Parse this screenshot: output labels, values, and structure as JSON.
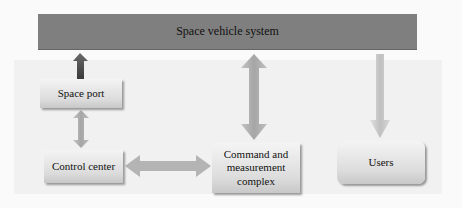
{
  "diagram": {
    "top_bar": {
      "label": "Space vehicle system"
    },
    "nodes": [
      {
        "id": "space-port",
        "label": "Space port"
      },
      {
        "id": "control-center",
        "label": "Control center"
      },
      {
        "id": "command-complex",
        "label": "Command and measurement complex"
      },
      {
        "id": "users",
        "label": "Users"
      }
    ],
    "edges": [
      {
        "from": "space-port",
        "to": "space-vehicle-system",
        "type": "up-arrow"
      },
      {
        "from": "space-port",
        "to": "control-center",
        "type": "bidirectional"
      },
      {
        "from": "control-center",
        "to": "command-complex",
        "type": "bidirectional"
      },
      {
        "from": "command-complex",
        "to": "space-vehicle-system",
        "type": "bidirectional"
      },
      {
        "from": "space-vehicle-system",
        "to": "users",
        "type": "down-arrow"
      }
    ]
  },
  "colors": {
    "bar": "#7f7f7f",
    "box_light": "#f4f4f4",
    "box_dark": "#c8c8c8",
    "arrow": "#a8a8a8"
  }
}
